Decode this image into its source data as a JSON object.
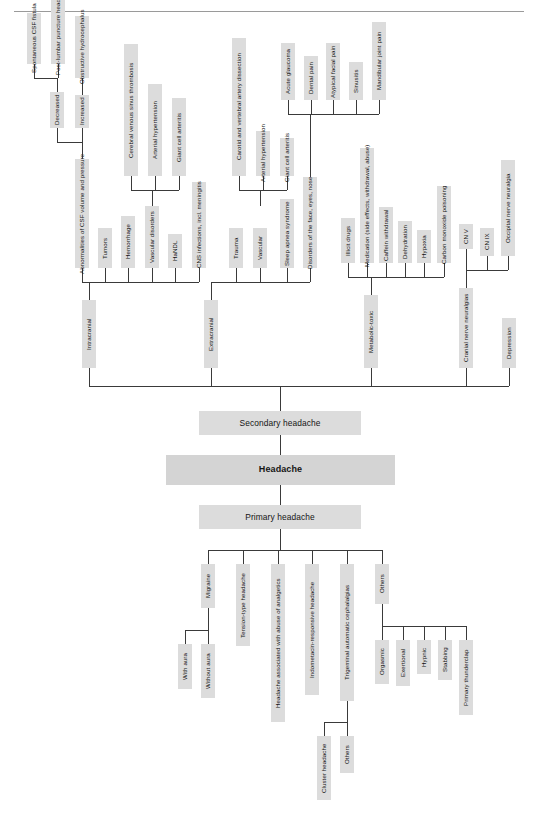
{
  "diagram": {
    "root_label": "Headache",
    "colors": {
      "node_fill": "#dcdcdc",
      "root_fill": "#d4d4d4",
      "line": "#3a3a3a",
      "rule": "#9a9a9a",
      "text": "#141414",
      "background": "#ffffff"
    },
    "spine": {
      "secondary": "Secondary headache",
      "root": "Headache",
      "primary": "Primary headache"
    },
    "secondary": {
      "categories": [
        "Intracranial",
        "Extracranial",
        "Metabolic-toxic",
        "Cranial nerve neuralgias",
        "Depression"
      ],
      "intracranial": {
        "label": "Intracranial",
        "children": [
          "Abnormalities of CSF volume and pressure",
          "Tumors",
          "Hemorrhage",
          "Vascular disorders",
          "HaNDL",
          "CNS infections, incl. meningitis"
        ],
        "csf": {
          "label": "Abnormalities of CSF volume and pressure",
          "children": [
            "Decreased",
            "Increased"
          ],
          "decreased": {
            "label": "Decreased",
            "children": [
              "Spontaneous CSF fistula",
              "Post-lumbar puncture headache"
            ]
          },
          "increased": {
            "label": "Increased",
            "children": [
              "Obstructive hydrocephalus"
            ]
          }
        },
        "vascular_disorders": {
          "label": "Vascular disorders",
          "children": [
            "Cerebral venous sinus thrombosis",
            "Arterial hypertension",
            "Giant cell arteritis"
          ]
        }
      },
      "extracranial": {
        "label": "Extracranial",
        "children": [
          "Trauma",
          "Vascular",
          "Sleep apnea syndrome",
          "Disorders of the face, eyes, nose"
        ],
        "vascular": {
          "label": "Vascular",
          "children": [
            "Carotid and vertebral artery dissection",
            "Arterial hypertension",
            "Giant cell arteritis"
          ]
        },
        "face": {
          "label": "Disorders of the face, eyes, nose",
          "children": [
            "Acute glaucoma",
            "Dental pain",
            "Atypical facial pain",
            "Sinusitis",
            "Mandibular joint pain"
          ]
        }
      },
      "metabolic_toxic": {
        "label": "Metabolic-toxic",
        "children": [
          "Illicit drugs",
          "Medication (side effects, withdrawal, abuse)",
          "Caffein withdrawal",
          "Dehydration",
          "Hypoxia",
          "Carbon monoxide poisoning"
        ]
      },
      "cranial_nerve_neuralgias": {
        "label": "Cranial nerve neuralgias",
        "children": [
          "CN V",
          "CN IX",
          "Occipital nerve neuralgia"
        ]
      },
      "depression": {
        "label": "Depression"
      }
    },
    "primary": {
      "label": "Primary headache",
      "children": [
        "Migraine",
        "Tension-type headache",
        "Headache associated with abuse of analgetics",
        "Indometacin-responsive headache",
        "Trigeminal automatic cephalalgias",
        "Others"
      ],
      "migraine": {
        "label": "Migraine",
        "children": [
          "With aura",
          "Without aura"
        ]
      },
      "tac": {
        "label": "Trigeminal automatic cephalalgias",
        "children": [
          "Cluster headache",
          "Others"
        ]
      },
      "others": {
        "label": "Others",
        "children": [
          "Orgasmic",
          "Exertional",
          "Hypnic",
          "Stabbing",
          "Primary thunderclap"
        ]
      }
    }
  }
}
